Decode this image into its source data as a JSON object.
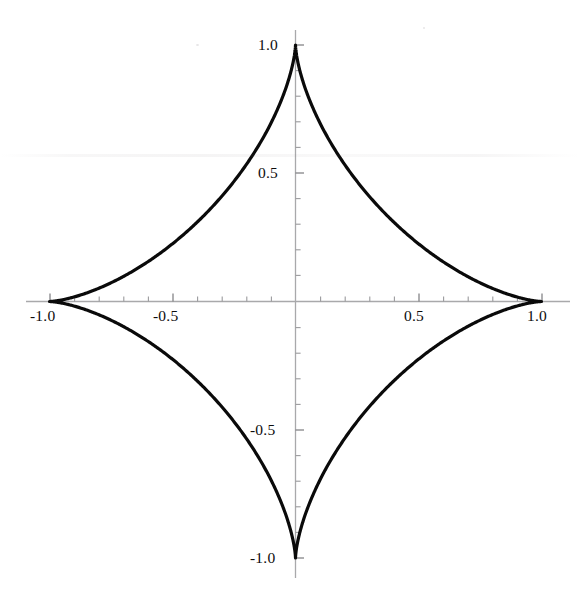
{
  "chart_data": {
    "type": "line",
    "title": "",
    "subtitle": "",
    "xlabel": "",
    "ylabel": "",
    "curve_name": "astroid",
    "equation": "x^(2/3) + y^(2/3) = 1",
    "parametric": {
      "x": "cos(t)^3",
      "y": "sin(t)^3",
      "t_range": [
        0,
        6.283185307
      ]
    },
    "xlim": [
      -1.08,
      1.15
    ],
    "ylim": [
      -1.12,
      1.09
    ],
    "grid": false,
    "legend": null,
    "axes_style": "centered-cross",
    "line_color": "#0a0a0a",
    "line_width": 3.2,
    "axis_color": "#a7a7a9",
    "tick_color": "#8d8d90",
    "label_color": "#0d0d0d",
    "background_color": "#ffffff",
    "x_axis": {
      "major_ticks": [
        -1.0,
        -0.5,
        0.5,
        1.0
      ],
      "major_tick_labels": [
        "-1.0",
        "-0.5",
        "0.5",
        "1.0"
      ],
      "minor_tick_step": 0.1,
      "tick_direction": "up",
      "label_position": "below"
    },
    "y_axis": {
      "major_ticks": [
        1.0,
        0.5,
        -0.5,
        -1.0
      ],
      "major_tick_labels": [
        "1.0",
        "0.5",
        "-0.5",
        "-1.0"
      ],
      "minor_tick_step": 0.1,
      "tick_direction": "right",
      "label_position": "left"
    },
    "key_points": [
      {
        "label": "right cusp",
        "x": 1.0,
        "y": 0.0
      },
      {
        "label": "top cusp",
        "x": 0.0,
        "y": 1.0
      },
      {
        "label": "left cusp",
        "x": -1.0,
        "y": 0.0
      },
      {
        "label": "bottom cusp",
        "x": 0.0,
        "y": -1.0
      }
    ],
    "points": [
      {
        "x": 1.0,
        "y": 0.0
      },
      {
        "x": 0.9704,
        "y": 0.0002
      },
      {
        "x": 0.8861,
        "y": 0.0017
      },
      {
        "x": 0.7558,
        "y": 0.0056
      },
      {
        "x": 0.5924,
        "y": 0.0132
      },
      {
        "x": 0.4114,
        "y": 0.0258
      },
      {
        "x": 0.2304,
        "y": 0.0444
      },
      {
        "x": 0.067,
        "y": 0.0699
      },
      {
        "x": -0.0633,
        "y": 0.1029
      },
      {
        "x": -0.1472,
        "y": 0.1434
      },
      {
        "x": -0.1768,
        "y": 0.1913
      },
      {
        "x": -0.1472,
        "y": 0.2455
      },
      {
        "x": -0.0633,
        "y": 0.3048
      },
      {
        "x": 0.067,
        "y": 0.3672
      },
      {
        "x": 0.2304,
        "y": 0.4305
      },
      {
        "x": 0.4114,
        "y": 0.4919
      },
      {
        "x": 0.5924,
        "y": 0.5486
      },
      {
        "x": 0.7558,
        "y": 0.5977
      },
      {
        "x": 0.8861,
        "y": 0.6364
      },
      {
        "x": 0.9704,
        "y": 0.662
      },
      {
        "x": 0.0,
        "y": 1.0
      },
      {
        "x": -1.0,
        "y": 0.0
      },
      {
        "x": 0.0,
        "y": -1.0
      }
    ]
  },
  "labels": {
    "x_neg_one": "-1.0",
    "x_neg_half": "-0.5",
    "x_pos_half": "0.5",
    "x_pos_one": "1.0",
    "y_pos_one": "1.0",
    "y_pos_half": "0.5",
    "y_neg_half": "-0.5",
    "y_neg_one": "-1.0"
  }
}
